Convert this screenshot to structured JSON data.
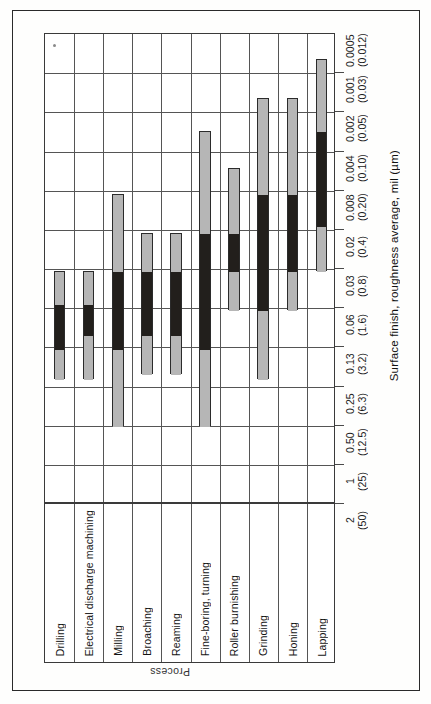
{
  "figure": {
    "value_axis_title": "Surface finish, roughness average, mil (µm)",
    "category_axis_title": "Process"
  },
  "chart_data": {
    "type": "bar",
    "orientation": "vertical-ranges",
    "title": "",
    "xlabel": "Process",
    "ylabel": "Surface finish, roughness average, mil (µm)",
    "grid": true,
    "legend": null,
    "note": "Each process shows a range band. Light gray = less frequent application; black = average application. Axis is reversed (coarse at bottom, fine at top).",
    "y_tick_labels": [
      {
        "mil": "0.0005",
        "um": "(0.012)"
      },
      {
        "mil": "0.001",
        "um": "(0.03)"
      },
      {
        "mil": "0.002",
        "um": "(0.05)"
      },
      {
        "mil": "0.004",
        "um": "(0.10)"
      },
      {
        "mil": "0.008",
        "um": "(0.20)"
      },
      {
        "mil": "0.02",
        "um": "(0.4)"
      },
      {
        "mil": "0.03",
        "um": "(0.8)"
      },
      {
        "mil": "0.06",
        "um": "(1.6)"
      },
      {
        "mil": "0.13",
        "um": "(3.2)"
      },
      {
        "mil": "0.25",
        "um": "(6.3)"
      },
      {
        "mil": "0.50",
        "um": "(12.5)"
      },
      {
        "mil": "1",
        "um": "(25)"
      },
      {
        "mil": "2",
        "um": "(50)"
      }
    ],
    "categories": [
      "Drilling",
      "Electrical discharge machining",
      "Milling",
      "Broaching",
      "Reaming",
      "Fine-boring, turning",
      "Roller burnishing",
      "Grinding",
      "Honing",
      "Lapping"
    ],
    "series": [
      {
        "name": "Drilling",
        "range_mil": [
          0.03,
          0.5
        ],
        "range_um": [
          0.8,
          12.5
        ],
        "average_mil": [
          0.06,
          0.25
        ],
        "average_um": [
          1.6,
          6.3
        ]
      },
      {
        "name": "Electrical discharge machining",
        "range_mil": [
          0.03,
          0.5
        ],
        "range_um": [
          0.8,
          12.5
        ],
        "average_mil": [
          0.06,
          0.2
        ],
        "average_um": [
          1.6,
          5.0
        ]
      },
      {
        "name": "Milling",
        "range_mil": [
          0.008,
          1.0
        ],
        "range_um": [
          0.2,
          25.0
        ],
        "average_mil": [
          0.03,
          0.5
        ],
        "average_um": [
          0.8,
          12.5
        ]
      },
      {
        "name": "Broaching",
        "range_mil": [
          0.02,
          0.25
        ],
        "range_um": [
          0.4,
          6.3
        ],
        "average_mil": [
          0.03,
          0.13
        ],
        "average_um": [
          0.8,
          3.2
        ]
      },
      {
        "name": "Reaming",
        "range_mil": [
          0.02,
          0.25
        ],
        "range_um": [
          0.4,
          6.3
        ],
        "average_mil": [
          0.03,
          0.13
        ],
        "average_um": [
          0.8,
          3.2
        ]
      },
      {
        "name": "Fine-boring, turning",
        "range_mil": [
          0.002,
          1.0
        ],
        "range_um": [
          0.05,
          25.0
        ],
        "average_mil": [
          0.02,
          0.25
        ],
        "average_um": [
          0.4,
          6.3
        ]
      },
      {
        "name": "Roller burnishing",
        "range_mil": [
          0.004,
          0.03
        ],
        "range_um": [
          0.1,
          0.8
        ],
        "average_mil": [
          0.008,
          0.03
        ],
        "average_um": [
          0.2,
          0.8
        ]
      },
      {
        "name": "Grinding",
        "range_mil": [
          0.001,
          0.5
        ],
        "range_um": [
          0.03,
          12.5
        ],
        "average_mil": [
          0.004,
          0.06
        ],
        "average_um": [
          0.1,
          1.6
        ]
      },
      {
        "name": "Honing",
        "range_mil": [
          0.001,
          0.06
        ],
        "range_um": [
          0.03,
          1.6
        ],
        "average_mil": [
          0.004,
          0.03
        ],
        "average_um": [
          0.1,
          0.8
        ]
      },
      {
        "name": "Lapping",
        "range_mil": [
          0.0005,
          0.03
        ],
        "range_um": [
          0.012,
          0.8
        ],
        "average_mil": [
          0.002,
          0.02
        ],
        "average_um": [
          0.05,
          0.4
        ]
      }
    ],
    "bars_px": [
      {
        "col": 0,
        "top": 270,
        "segments": [
          {
            "kind": "gray",
            "top": 270,
            "bottom": 303
          },
          {
            "kind": "black",
            "top": 303,
            "bottom": 348
          },
          {
            "kind": "gray",
            "top": 348,
            "bottom": 378
          }
        ]
      },
      {
        "col": 1,
        "top": 270,
        "segments": [
          {
            "kind": "gray",
            "top": 270,
            "bottom": 303
          },
          {
            "kind": "black",
            "top": 303,
            "bottom": 334
          },
          {
            "kind": "gray",
            "top": 334,
            "bottom": 378
          }
        ]
      },
      {
        "col": 2,
        "top": 193,
        "segments": [
          {
            "kind": "gray",
            "top": 193,
            "bottom": 270
          },
          {
            "kind": "black",
            "top": 270,
            "bottom": 348
          },
          {
            "kind": "gray",
            "top": 348,
            "bottom": 425
          }
        ]
      },
      {
        "col": 3,
        "top": 232,
        "segments": [
          {
            "kind": "gray",
            "top": 232,
            "bottom": 270
          },
          {
            "kind": "black",
            "top": 270,
            "bottom": 334
          },
          {
            "kind": "gray",
            "top": 334,
            "bottom": 373
          }
        ]
      },
      {
        "col": 4,
        "top": 232,
        "segments": [
          {
            "kind": "gray",
            "top": 232,
            "bottom": 270
          },
          {
            "kind": "black",
            "top": 270,
            "bottom": 334
          },
          {
            "kind": "gray",
            "top": 334,
            "bottom": 373
          }
        ]
      },
      {
        "col": 5,
        "top": 130,
        "segments": [
          {
            "kind": "gray",
            "top": 130,
            "bottom": 232
          },
          {
            "kind": "black",
            "top": 232,
            "bottom": 348
          },
          {
            "kind": "gray",
            "top": 348,
            "bottom": 425
          }
        ]
      },
      {
        "col": 6,
        "top": 167,
        "segments": [
          {
            "kind": "gray",
            "top": 167,
            "bottom": 232
          },
          {
            "kind": "black",
            "top": 232,
            "bottom": 270
          },
          {
            "kind": "gray",
            "top": 270,
            "bottom": 309
          }
        ]
      },
      {
        "col": 7,
        "top": 97,
        "segments": [
          {
            "kind": "gray",
            "top": 97,
            "bottom": 193
          },
          {
            "kind": "black",
            "top": 193,
            "bottom": 309
          },
          {
            "kind": "gray",
            "top": 309,
            "bottom": 378
          }
        ]
      },
      {
        "col": 8,
        "top": 97,
        "segments": [
          {
            "kind": "gray",
            "top": 97,
            "bottom": 193
          },
          {
            "kind": "black",
            "top": 193,
            "bottom": 270
          },
          {
            "kind": "gray",
            "top": 270,
            "bottom": 309
          }
        ]
      },
      {
        "col": 9,
        "top": 58,
        "segments": [
          {
            "kind": "gray",
            "top": 58,
            "bottom": 130
          },
          {
            "kind": "black",
            "top": 130,
            "bottom": 225
          },
          {
            "kind": "gray",
            "top": 225,
            "bottom": 270
          }
        ]
      }
    ]
  },
  "colors": {
    "range_band": "#b6b6b6",
    "average_band": "#221f1c",
    "grid_line": "#555555",
    "frame": "#2a2a2a",
    "paper": "#fefefd"
  }
}
